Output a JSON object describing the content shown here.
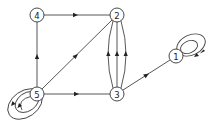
{
  "diagram": {
    "type": "directed-graph",
    "colors": {
      "stroke": "#444444",
      "node_fill": "#ffffff",
      "text": "#222222"
    },
    "nodes": [
      {
        "id": "1",
        "label": "1",
        "x": 176,
        "y": 56
      },
      {
        "id": "2",
        "label": "2",
        "x": 117,
        "y": 15
      },
      {
        "id": "3",
        "label": "3",
        "x": 117,
        "y": 94
      },
      {
        "id": "4",
        "label": "4",
        "x": 37,
        "y": 15
      },
      {
        "id": "5",
        "label": "5",
        "x": 37,
        "y": 94
      }
    ],
    "edges": [
      {
        "from": "4",
        "to": "2"
      },
      {
        "from": "5",
        "to": "4"
      },
      {
        "from": "5",
        "to": "2"
      },
      {
        "from": "5",
        "to": "3"
      },
      {
        "from": "3",
        "to": "1"
      },
      {
        "from": "3",
        "to": "2",
        "curve": "left"
      },
      {
        "from": "3",
        "to": "2",
        "curve": "straight"
      },
      {
        "from": "3",
        "to": "2",
        "curve": "right"
      },
      {
        "from": "5",
        "to": "5",
        "type": "self-loop"
      },
      {
        "from": "5",
        "to": "5",
        "type": "self-loop"
      },
      {
        "from": "1",
        "to": "1",
        "type": "self-loop"
      },
      {
        "from": "1",
        "to": "1",
        "type": "self-loop"
      }
    ]
  }
}
